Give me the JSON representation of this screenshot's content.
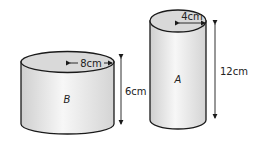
{
  "cylinders": [
    {
      "name": "B",
      "radius_label": "8cm",
      "height_label": "6cm"
    },
    {
      "name": "A",
      "radius_label": "4cm",
      "height_label": "12cm"
    }
  ],
  "colors": {
    "stroke": "#1a1a1a",
    "body_fill": "#ececec",
    "top_fill": "#d6d6d6"
  }
}
